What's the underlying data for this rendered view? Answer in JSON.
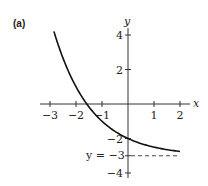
{
  "panel_label": "(a)",
  "chart_data": {
    "type": "line",
    "title": "",
    "xlabel": "x",
    "ylabel": "y",
    "xlim": [
      -3,
      2
    ],
    "ylim": [
      -4,
      4
    ],
    "x_ticks": [
      -3,
      -2,
      -1,
      1,
      2
    ],
    "x_tick_labels": [
      "−3",
      "−2",
      "−1",
      "1",
      "2"
    ],
    "y_ticks": [
      4,
      2,
      -2,
      -3,
      -4
    ],
    "y_tick_labels": [
      "4",
      "2",
      "−2",
      "−3",
      "−4"
    ],
    "grid": false,
    "series": [
      {
        "name": "curve",
        "function": "y = 2^(-x) - 3",
        "x_range": [
          -2.85,
          2
        ],
        "points": [
          [
            -2.85,
            4.21
          ],
          [
            -2.5,
            2.66
          ],
          [
            -2,
            1
          ],
          [
            -1.585,
            0
          ],
          [
            -1,
            -1
          ],
          [
            0,
            -2
          ],
          [
            1,
            -2.5
          ],
          [
            2,
            -2.75
          ]
        ]
      }
    ],
    "annotations": [
      {
        "type": "asymptote",
        "label": "y = −3",
        "y": -3,
        "style": "dashed",
        "x_range": [
          0,
          2
        ]
      }
    ]
  }
}
